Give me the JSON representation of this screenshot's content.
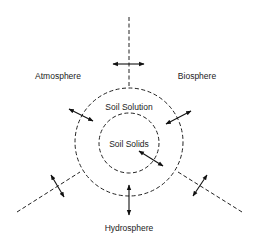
{
  "diagram": {
    "type": "concentric-exchange-diagram",
    "labels": {
      "atmosphere": "Atmosphere",
      "biosphere": "Biosphere",
      "hydrosphere": "Hydrosphere",
      "soil_solution": "Soil Solution",
      "soil_solids": "Soil Solids"
    },
    "regions": [
      {
        "name": "Soil Solids",
        "shape": "inner dashed circle"
      },
      {
        "name": "Soil Solution",
        "shape": "outer dashed circle"
      },
      {
        "name": "Atmosphere",
        "position": "upper-left sector"
      },
      {
        "name": "Biosphere",
        "position": "upper-right sector"
      },
      {
        "name": "Hydrosphere",
        "position": "bottom sector"
      }
    ],
    "exchanges": [
      {
        "from": "Atmosphere",
        "to": "Biosphere",
        "style": "double-headed arrow"
      },
      {
        "from": "Atmosphere",
        "to": "Soil Solution",
        "style": "double-headed arrow"
      },
      {
        "from": "Biosphere",
        "to": "Soil Solution",
        "style": "double-headed arrow"
      },
      {
        "from": "Soil Solids",
        "to": "Soil Solution",
        "style": "double-headed arrow"
      },
      {
        "from": "Hydrosphere",
        "to": "Soil Solution",
        "style": "double-headed arrow"
      },
      {
        "from": "Atmosphere",
        "to": "Hydrosphere",
        "style": "double-headed arrow"
      },
      {
        "from": "Biosphere",
        "to": "Hydrosphere",
        "style": "double-headed arrow"
      }
    ],
    "colors": {
      "line": "#222222",
      "background": "#ffffff"
    }
  }
}
